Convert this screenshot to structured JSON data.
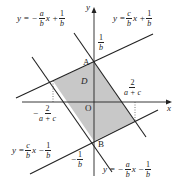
{
  "axes": {
    "x_label": "x",
    "y_label": "y",
    "origin_label": "O"
  },
  "points": {
    "A": "A",
    "B": "B"
  },
  "region_label": "D",
  "region_color": "#c8c8c8",
  "line_color": "#222222",
  "lines": [
    {
      "id": "top-left",
      "lhs": "y = −",
      "num": "a",
      "den": "b",
      "mid": "x +",
      "cnum": "1",
      "cden": "b"
    },
    {
      "id": "top-right",
      "lhs": "y =",
      "num": "c",
      "den": "b",
      "mid": "x +",
      "cnum": "1",
      "cden": "b"
    },
    {
      "id": "bottom-left",
      "lhs": "y =",
      "num": "c",
      "den": "b",
      "mid": "x −",
      "cnum": "1",
      "cden": "b"
    },
    {
      "id": "bottom-right",
      "lhs": "y = −",
      "num": "a",
      "den": "b",
      "mid": "x −",
      "cnum": "1",
      "cden": "b"
    }
  ],
  "ticks": {
    "y_pos": {
      "num": "1",
      "den": "b"
    },
    "y_neg": {
      "sign": "−",
      "num": "1",
      "den": "b"
    },
    "x_pos": {
      "num": "2",
      "den": "a + c"
    },
    "x_neg": {
      "sign": "−",
      "num": "2",
      "den": "a + c"
    }
  }
}
